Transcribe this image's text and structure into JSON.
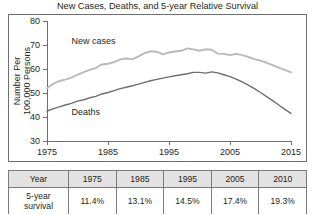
{
  "chart_data": {
    "type": "line",
    "title": "New Cases, Deaths, and 5-year Relative Survival",
    "xlabel": "Year",
    "ylabel_line1": "Number Per",
    "ylabel_line2": "100,000 Persons",
    "xlim": [
      1975,
      2015
    ],
    "ylim": [
      30,
      80
    ],
    "xticks": [
      1975,
      1985,
      1995,
      2005,
      2015
    ],
    "yticks": [
      30,
      40,
      50,
      60,
      70,
      80
    ],
    "grid": false,
    "legend": "inline-labels",
    "series": [
      {
        "name": "New cases",
        "color": "#b9b9b9",
        "label_x": 1979,
        "label_y": 70.5,
        "x": [
          1975,
          1976,
          1977,
          1978,
          1979,
          1980,
          1981,
          1982,
          1983,
          1984,
          1985,
          1986,
          1987,
          1988,
          1989,
          1990,
          1991,
          1992,
          1993,
          1994,
          1995,
          1996,
          1997,
          1998,
          1999,
          2000,
          2001,
          2002,
          2003,
          2004,
          2005,
          2006,
          2007,
          2008,
          2009,
          2010,
          2011,
          2012,
          2013,
          2014,
          2015
        ],
        "y": [
          52.0,
          53.8,
          55.0,
          55.6,
          56.4,
          57.6,
          58.7,
          59.6,
          60.4,
          61.9,
          62.2,
          62.9,
          64.0,
          64.4,
          64.0,
          65.3,
          66.6,
          67.4,
          67.2,
          66.1,
          66.9,
          67.3,
          67.6,
          68.6,
          68.2,
          67.6,
          68.2,
          68.0,
          66.4,
          66.3,
          65.8,
          66.3,
          65.8,
          65.0,
          64.1,
          63.5,
          62.6,
          61.6,
          60.6,
          59.6,
          58.6
        ]
      },
      {
        "name": "Deaths",
        "color": "#6e6e6e",
        "label_x": 1979,
        "label_y": 40.8,
        "x": [
          1975,
          1976,
          1977,
          1978,
          1979,
          1980,
          1981,
          1982,
          1983,
          1984,
          1985,
          1986,
          1987,
          1988,
          1989,
          1990,
          1991,
          1992,
          1993,
          1994,
          1995,
          1996,
          1997,
          1998,
          1999,
          2000,
          2001,
          2002,
          2003,
          2004,
          2005,
          2006,
          2007,
          2008,
          2009,
          2010,
          2011,
          2012,
          2013,
          2014,
          2015
        ],
        "y": [
          42.5,
          43.4,
          44.2,
          45.0,
          45.7,
          46.6,
          47.2,
          48.0,
          48.6,
          49.6,
          50.2,
          51.0,
          51.8,
          52.4,
          53.0,
          53.7,
          54.4,
          55.1,
          55.7,
          56.2,
          56.7,
          57.2,
          57.6,
          58.0,
          58.6,
          58.6,
          58.3,
          58.8,
          58.4,
          57.6,
          56.8,
          55.8,
          54.6,
          53.3,
          51.8,
          50.2,
          48.5,
          46.8,
          45.0,
          43.2,
          41.5
        ]
      }
    ]
  },
  "table": {
    "header": [
      "Year",
      "1975",
      "1985",
      "1995",
      "2005",
      "2010"
    ],
    "row_label": "5-year survival",
    "row_label_line1": "5-year",
    "row_label_line2": "survival",
    "values": [
      "11.4%",
      "13.1%",
      "14.5%",
      "17.4%",
      "19.3%"
    ]
  }
}
